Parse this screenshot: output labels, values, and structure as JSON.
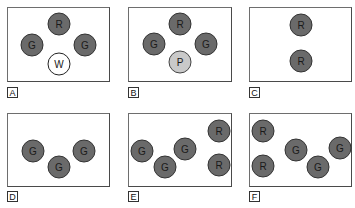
{
  "panels": [
    {
      "label": "A",
      "circles": [
        {
          "text": "R",
          "fill": "dark"
        },
        {
          "text": "G",
          "fill": "dark"
        },
        {
          "text": "G",
          "fill": "dark"
        },
        {
          "text": "W",
          "fill": "white"
        }
      ]
    },
    {
      "label": "B",
      "circles": [
        {
          "text": "R",
          "fill": "dark"
        },
        {
          "text": "G",
          "fill": "dark"
        },
        {
          "text": "G",
          "fill": "dark"
        },
        {
          "text": "P",
          "fill": "light"
        }
      ]
    },
    {
      "label": "C",
      "circles": [
        {
          "text": "R",
          "fill": "dark"
        },
        {
          "text": "R",
          "fill": "dark"
        }
      ]
    },
    {
      "label": "D",
      "circles": [
        {
          "text": "G",
          "fill": "dark"
        },
        {
          "text": "G",
          "fill": "dark"
        },
        {
          "text": "G",
          "fill": "dark"
        }
      ]
    },
    {
      "label": "E",
      "circles": [
        {
          "text": "G",
          "fill": "dark"
        },
        {
          "text": "G",
          "fill": "dark"
        },
        {
          "text": "G",
          "fill": "dark"
        },
        {
          "text": "R",
          "fill": "dark"
        },
        {
          "text": "R",
          "fill": "dark"
        }
      ]
    },
    {
      "label": "F",
      "circles": [
        {
          "text": "R",
          "fill": "dark"
        },
        {
          "text": "R",
          "fill": "dark"
        },
        {
          "text": "G",
          "fill": "dark"
        },
        {
          "text": "G",
          "fill": "dark"
        },
        {
          "text": "G",
          "fill": "dark"
        }
      ]
    }
  ],
  "colors": {
    "dark": "#6a6a6a",
    "white": "#ffffff",
    "light": "#c9c9c9",
    "border": "#333333"
  }
}
